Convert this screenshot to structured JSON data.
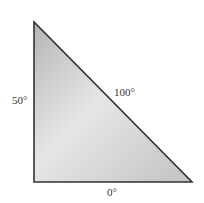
{
  "diagram": {
    "shape": "right-triangle",
    "fill_gradient": [
      "#b8b8b8",
      "#e8e8e8",
      "#c4c4c4"
    ],
    "stroke_color": "#333333",
    "labels": {
      "left_side": "50°",
      "hypotenuse": "100°",
      "bottom_side": "0°",
      "corner_mark": "t"
    }
  }
}
